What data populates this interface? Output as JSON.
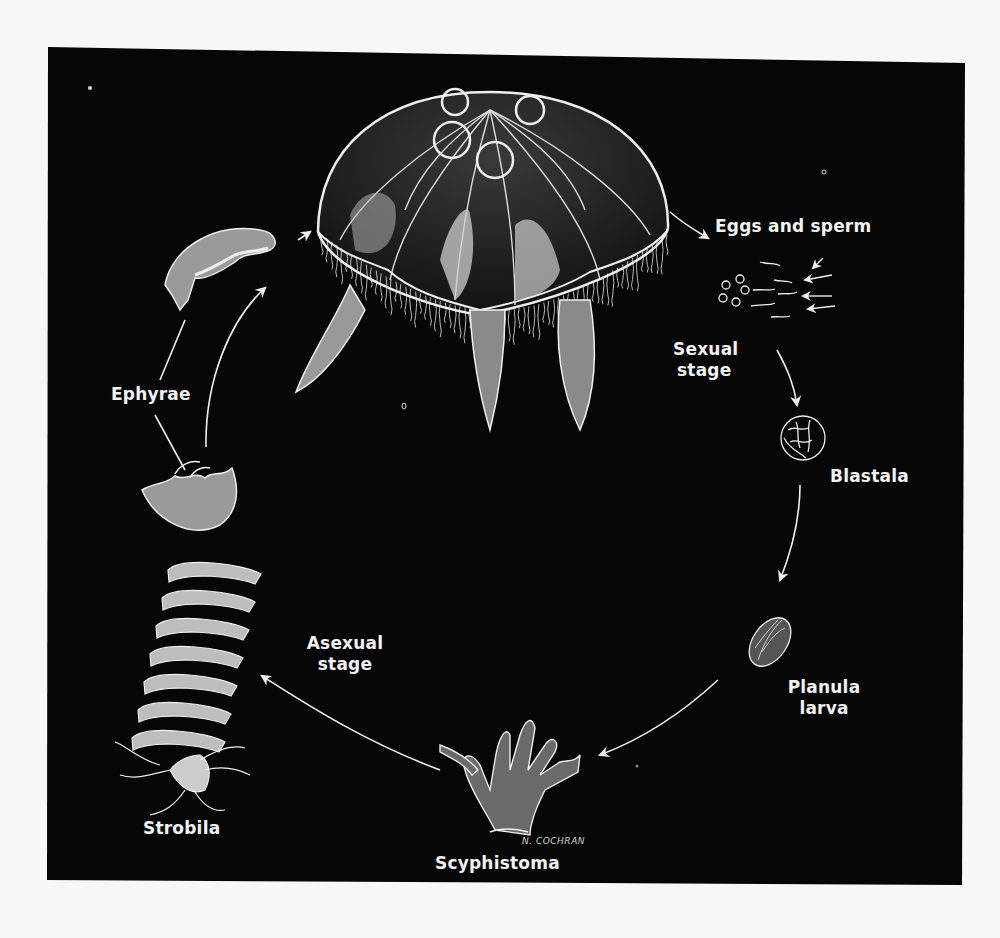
{
  "diagram": {
    "colors": {
      "background_panel": "#060606",
      "page": "#f7f7f5",
      "ink": "#f0f0f0"
    },
    "stages": [
      {
        "id": "medusa",
        "label": ""
      },
      {
        "id": "eggs-sperm",
        "label": "Eggs and sperm"
      },
      {
        "id": "blastala",
        "label": "Blastala"
      },
      {
        "id": "planula",
        "label_line1": "Planula",
        "label_line2": "larva"
      },
      {
        "id": "scyphistoma",
        "label": "Scyphistoma"
      },
      {
        "id": "strobila",
        "label": "Strobila"
      },
      {
        "id": "ephyrae",
        "label": "Ephyrae"
      }
    ],
    "phases": {
      "sexual": {
        "line1": "Sexual",
        "line2": "stage"
      },
      "asexual": {
        "line1": "Asexual",
        "line2": "stage"
      }
    },
    "signature": "N. COCHRAN"
  }
}
